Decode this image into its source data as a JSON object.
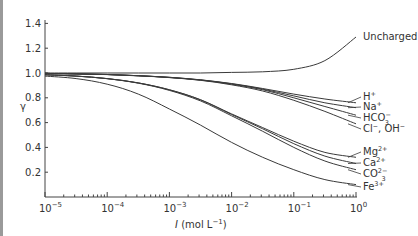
{
  "chart_data": {
    "type": "line",
    "title": "",
    "xlabel": "I (mol L⁻¹)",
    "ylabel": "γ",
    "xscale": "log",
    "xlim": [
      1e-05,
      1
    ],
    "ylim": [
      0,
      1.4
    ],
    "grid": false,
    "x_ticks": [
      {
        "value": -5,
        "base": "10",
        "exp": "−5"
      },
      {
        "value": -4,
        "base": "10",
        "exp": "−4"
      },
      {
        "value": -3,
        "base": "10",
        "exp": "−3"
      },
      {
        "value": -2,
        "base": "10",
        "exp": "−2"
      },
      {
        "value": -1,
        "base": "10",
        "exp": "−1"
      },
      {
        "value": 0,
        "base": "10",
        "exp": "0"
      }
    ],
    "y_ticks": [
      "0.2",
      "0.4",
      "0.6",
      "0.8",
      "1.0",
      "1.2",
      "1.4"
    ],
    "x_log10": [
      -5,
      -4.5,
      -4,
      -3.5,
      -3,
      -2.5,
      -2,
      -1.5,
      -1,
      -0.5,
      0
    ],
    "series": [
      {
        "name": "Uncharged",
        "label_main": "Uncharged",
        "label_sup": "",
        "label_sub": "",
        "values": [
          1.0,
          1.0,
          1.0,
          1.0,
          1.0,
          1.0,
          1.005,
          1.01,
          1.03,
          1.1,
          1.29
        ]
      },
      {
        "name": "H+",
        "label_main": "H",
        "label_sup": "+",
        "label_sub": "",
        "values": [
          0.997,
          0.993,
          0.988,
          0.978,
          0.965,
          0.945,
          0.915,
          0.875,
          0.83,
          0.79,
          0.76
        ]
      },
      {
        "name": "Na+",
        "label_main": "Na",
        "label_sup": "+",
        "label_sub": "",
        "values": [
          0.997,
          0.993,
          0.988,
          0.978,
          0.965,
          0.944,
          0.913,
          0.87,
          0.815,
          0.76,
          0.72
        ]
      },
      {
        "name": "HCO3-",
        "label_main": "HCO",
        "label_sup": "−",
        "label_sub": "3",
        "values": [
          0.997,
          0.993,
          0.988,
          0.978,
          0.964,
          0.943,
          0.91,
          0.865,
          0.8,
          0.73,
          0.66
        ]
      },
      {
        "name": "Cl-, OH-",
        "label_main": "Cl⁻, OH⁻",
        "label_sup": "",
        "label_sub": "",
        "values": [
          0.997,
          0.993,
          0.987,
          0.977,
          0.963,
          0.941,
          0.905,
          0.855,
          0.78,
          0.69,
          0.59
        ]
      },
      {
        "name": "Mg2+",
        "label_main": "Mg",
        "label_sup": "2+",
        "label_sub": "",
        "values": [
          0.986,
          0.975,
          0.955,
          0.92,
          0.865,
          0.785,
          0.67,
          0.56,
          0.45,
          0.36,
          0.32
        ]
      },
      {
        "name": "Ca2+",
        "label_main": "Ca",
        "label_sup": "2+",
        "label_sub": "",
        "values": [
          0.986,
          0.975,
          0.955,
          0.92,
          0.864,
          0.783,
          0.665,
          0.55,
          0.43,
          0.33,
          0.27
        ]
      },
      {
        "name": "CO32-",
        "label_main": "CO",
        "label_sup": "2−",
        "label_sub": "3",
        "values": [
          0.986,
          0.975,
          0.954,
          0.918,
          0.86,
          0.775,
          0.655,
          0.53,
          0.4,
          0.29,
          0.22
        ]
      },
      {
        "name": "Fe3+",
        "label_main": "Fe",
        "label_sup": "3+",
        "label_sub": "",
        "values": [
          0.975,
          0.955,
          0.91,
          0.83,
          0.71,
          0.58,
          0.44,
          0.32,
          0.22,
          0.14,
          0.1
        ]
      }
    ]
  },
  "axes": {
    "x_label_italic": "I",
    "x_label_rest": " (mol L",
    "x_label_sup": "−1",
    "x_label_close": ")",
    "y_label": "γ"
  }
}
